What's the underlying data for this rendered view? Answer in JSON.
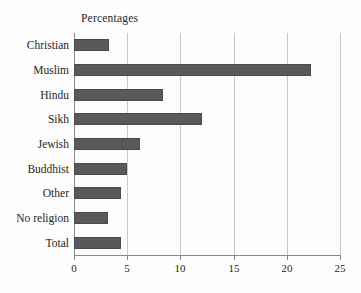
{
  "chart_data": {
    "type": "bar",
    "orientation": "horizontal",
    "title": "Percentages",
    "xlabel": "",
    "ylabel": "",
    "categories": [
      "Christian",
      "Muslim",
      "Hindu",
      "Sikh",
      "Jewish",
      "Buddhist",
      "Other",
      "No religion",
      "Total"
    ],
    "values": [
      3.3,
      22.3,
      8.4,
      12.0,
      6.2,
      5.0,
      4.4,
      3.2,
      4.4
    ],
    "xlim": [
      0,
      25
    ],
    "xticks": [
      0,
      5,
      10,
      15,
      20,
      25
    ],
    "xtick_labels": [
      "0",
      "5",
      "10",
      "15",
      "20",
      "25"
    ],
    "grid": "vertical",
    "legend": "none",
    "bar_color": "#595959",
    "gridline_color": "#c9c9c9",
    "axis_color": "#8a8a8a",
    "background_color": "#fdfdfd"
  }
}
